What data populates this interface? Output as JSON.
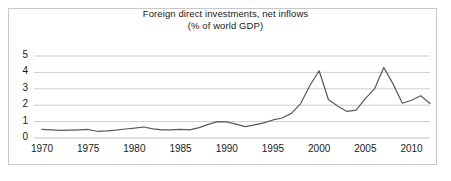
{
  "chart": {
    "title_line1": "Foreign direct investments, net inflows",
    "title_line2": "(% of world GDP)",
    "border_color": "#c8c8c8",
    "gridline_color": "#c0c0c0",
    "line_color": "#595959",
    "background": "#ffffff"
  },
  "chart_data": {
    "type": "line",
    "title": "Foreign direct investments, net inflows (% of world GDP)",
    "xlabel": "",
    "ylabel": "",
    "xlim": [
      1970,
      2012
    ],
    "ylim": [
      0,
      5
    ],
    "grid": true,
    "legend": "none",
    "yticks": [
      0,
      1,
      2,
      3,
      4,
      5
    ],
    "ytick_labels": [
      "0",
      "1",
      "2",
      "3",
      "4",
      "5"
    ],
    "xticks": [
      1970,
      1975,
      1980,
      1985,
      1990,
      1995,
      2000,
      2005,
      2010
    ],
    "xtick_labels": [
      "1970",
      "1975",
      "1980",
      "1985",
      "1990",
      "1995",
      "2000",
      "2005",
      "2010"
    ],
    "series": [
      {
        "name": "Foreign direct investments, net inflows (% of world GDP)",
        "x": [
          1970,
          1971,
          1972,
          1973,
          1974,
          1975,
          1976,
          1977,
          1978,
          1979,
          1980,
          1981,
          1982,
          1983,
          1984,
          1985,
          1986,
          1987,
          1988,
          1989,
          1990,
          1991,
          1992,
          1993,
          1994,
          1995,
          1996,
          1997,
          1998,
          1999,
          2000,
          2001,
          2002,
          2003,
          2004,
          2005,
          2006,
          2007,
          2008,
          2009,
          2010,
          2011,
          2012
        ],
        "values": [
          0.52,
          0.5,
          0.47,
          0.48,
          0.5,
          0.52,
          0.41,
          0.43,
          0.48,
          0.55,
          0.6,
          0.67,
          0.56,
          0.5,
          0.5,
          0.53,
          0.5,
          0.63,
          0.83,
          1.0,
          0.98,
          0.85,
          0.69,
          0.8,
          0.92,
          1.1,
          1.22,
          1.5,
          2.1,
          3.2,
          4.1,
          2.35,
          1.95,
          1.62,
          1.7,
          2.4,
          3.0,
          4.3,
          3.3,
          2.12,
          2.3,
          2.58,
          2.1
        ]
      }
    ]
  }
}
